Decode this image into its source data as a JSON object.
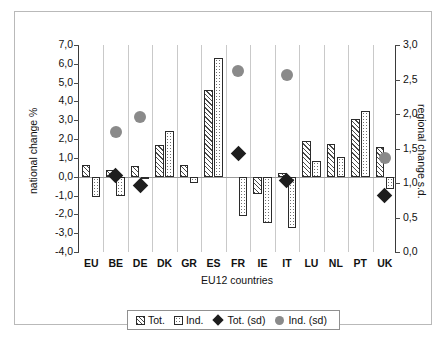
{
  "chart_data": {
    "type": "bar",
    "title": "",
    "xlabel": "EU12 countries",
    "ylabel": "national change %",
    "ylabel_secondary": "regional change s.d.",
    "grid": "vertical category separators only",
    "legend_position": "bottom-center",
    "ylim": [
      -4.0,
      7.0
    ],
    "ylim_secondary": [
      0.0,
      3.0
    ],
    "ytick_labels": [
      "7,0",
      "6,0",
      "5,0",
      "4,0",
      "3,0",
      "2,0",
      "1,0",
      "0,0",
      "-1,0",
      "-2,0",
      "-3,0",
      "-4,0"
    ],
    "ytick_values": [
      7,
      6,
      5,
      4,
      3,
      2,
      1,
      0,
      -1,
      -2,
      -3,
      -4
    ],
    "ytick_labels_secondary": [
      "3,0",
      "2,5",
      "2,0",
      "1,5",
      "1,0",
      "0,5",
      "0,0"
    ],
    "ytick_values_secondary": [
      3.0,
      2.5,
      2.0,
      1.5,
      1.0,
      0.5,
      0.0
    ],
    "categories": [
      "EU",
      "BE",
      "DE",
      "DK",
      "GR",
      "ES",
      "FR",
      "IE",
      "IT",
      "LU",
      "NL",
      "PT",
      "UK"
    ],
    "series": [
      {
        "name": "Tot.",
        "axis": "left",
        "kind": "bar",
        "values": [
          0.6,
          0.35,
          0.55,
          1.7,
          0.6,
          4.6,
          null,
          -0.9,
          0.2,
          1.9,
          1.75,
          3.05,
          1.6
        ]
      },
      {
        "name": "Ind.",
        "axis": "left",
        "kind": "bar",
        "values": [
          -1.1,
          -1.05,
          -0.05,
          2.45,
          -0.35,
          6.3,
          -2.1,
          -2.45,
          -2.7,
          0.85,
          1.05,
          3.5,
          -0.65
        ]
      },
      {
        "name": "Tot. (sd)",
        "axis": "right",
        "kind": "diamond",
        "values": [
          null,
          1.11,
          0.96,
          null,
          null,
          null,
          1.43,
          null,
          1.03,
          null,
          null,
          null,
          0.82
        ]
      },
      {
        "name": "Ind. (sd)",
        "axis": "right",
        "kind": "circle",
        "values": [
          null,
          1.74,
          1.95,
          null,
          null,
          null,
          2.63,
          null,
          2.57,
          null,
          null,
          null,
          1.36
        ]
      }
    ]
  },
  "legend": {
    "items": [
      {
        "label": "Tot."
      },
      {
        "label": "Ind."
      },
      {
        "label": "Tot. (sd)"
      },
      {
        "label": "Ind. (sd)"
      }
    ]
  }
}
